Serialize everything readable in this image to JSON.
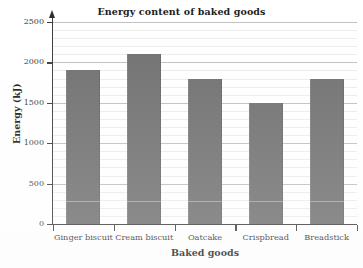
{
  "chart_data": {
    "type": "bar",
    "title": "Energy content of baked goods",
    "xlabel": "Baked goods",
    "ylabel": "Energy (kJ)",
    "categories": [
      "Ginger biscuit",
      "Cream biscuit",
      "Oatcake",
      "Crispbread",
      "Breadstick"
    ],
    "values": [
      1900,
      2100,
      1800,
      1500,
      1800
    ],
    "ylim": [
      0,
      2500
    ],
    "y_ticks": [
      0,
      500,
      1000,
      1500,
      2000,
      2500
    ],
    "y_tick_labels": [
      "0",
      "500",
      "1000",
      "1500",
      "2000",
      "2500"
    ],
    "y_minor_tick_step": 100,
    "grid": "horizontal",
    "legend": "none",
    "bar_color": "#6e6e6e",
    "gridline_major_color": "#bfbfbf",
    "gridline_minor_color": "#ececec",
    "axis_color": "#3a3a3a",
    "background_color": "#ffffff"
  }
}
